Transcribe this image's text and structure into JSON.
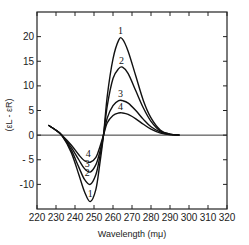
{
  "chart_data": {
    "type": "line",
    "title": "",
    "xlabel": "Wavelength (mμ)",
    "ylabel": "(εL - εR)",
    "xlim": [
      220,
      320
    ],
    "ylim": [
      -15,
      25
    ],
    "x_ticks": [
      220,
      230,
      240,
      250,
      260,
      270,
      280,
      290,
      300,
      310,
      320
    ],
    "y_ticks": [
      -10,
      -5,
      0,
      5,
      10,
      15,
      20
    ],
    "y_tick_labels": [
      "-10",
      "- 5",
      "0",
      "5",
      "10",
      "15",
      "20"
    ],
    "grid": false,
    "legend": "inline curve labels 1-4",
    "zero_line": true,
    "series": [
      {
        "name": "1",
        "x": [
          226,
          230,
          233,
          238,
          242,
          245,
          248,
          251,
          253,
          255,
          257,
          260,
          263,
          265,
          268,
          272,
          276,
          280,
          285,
          290,
          295
        ],
        "y": [
          2,
          1,
          0,
          -3.5,
          -8,
          -11.5,
          -13.5,
          -11,
          -6,
          0,
          8,
          15.5,
          19.3,
          19.5,
          17,
          12,
          7,
          3.5,
          1,
          0.2,
          0
        ]
      },
      {
        "name": "2",
        "x": [
          226,
          230,
          233,
          238,
          242,
          245,
          248,
          251,
          253,
          255,
          257,
          260,
          263,
          265,
          268,
          272,
          276,
          280,
          285,
          290,
          295
        ],
        "y": [
          2,
          1,
          0,
          -3,
          -6.5,
          -9,
          -10,
          -8,
          -4.5,
          0,
          6,
          11.5,
          13.5,
          13.8,
          12.5,
          9,
          5.5,
          2.8,
          0.8,
          0.2,
          0
        ]
      },
      {
        "name": "3",
        "x": [
          226,
          230,
          233,
          238,
          242,
          245,
          248,
          251,
          253,
          255,
          257,
          260,
          263,
          265,
          268,
          272,
          276,
          280,
          285,
          290,
          295
        ],
        "y": [
          2,
          1,
          0,
          -2.5,
          -5,
          -6.8,
          -7.5,
          -6,
          -3.5,
          0,
          3.5,
          6,
          7,
          7,
          6.5,
          5,
          3.2,
          1.7,
          0.6,
          0.1,
          0
        ]
      },
      {
        "name": "4",
        "x": [
          226,
          230,
          233,
          238,
          242,
          245,
          248,
          251,
          253,
          255,
          257,
          260,
          263,
          265,
          268,
          272,
          276,
          280,
          285,
          290,
          295
        ],
        "y": [
          2,
          1,
          0,
          -2,
          -4,
          -5.2,
          -5.5,
          -4.5,
          -2.5,
          0,
          2.5,
          4,
          4.5,
          4.5,
          4.2,
          3.3,
          2.2,
          1.2,
          0.4,
          0.1,
          0
        ]
      }
    ],
    "annotations": [
      {
        "text": "1",
        "x": 264,
        "y": 20.5
      },
      {
        "text": "2",
        "x": 264.5,
        "y": 14.5
      },
      {
        "text": "3",
        "x": 264,
        "y": 7.8
      },
      {
        "text": "4",
        "x": 264,
        "y": 5.2
      },
      {
        "text": "4",
        "x": 247,
        "y": -4.5
      },
      {
        "text": "3",
        "x": 246.5,
        "y": -6.5
      },
      {
        "text": "2",
        "x": 246.5,
        "y": -8.2
      },
      {
        "text": "1",
        "x": 248,
        "y": -12.5
      }
    ]
  }
}
